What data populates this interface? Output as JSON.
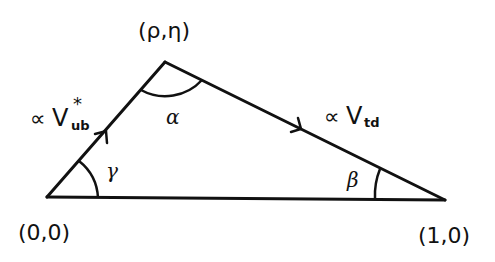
{
  "diagram": {
    "type": "unitarity-triangle",
    "stroke_color": "#111111",
    "background": "#ffffff",
    "vertices": {
      "origin": {
        "label": "(0,0)"
      },
      "apex": {
        "label": "(ρ,η)"
      },
      "right": {
        "label": "(1,0)"
      }
    },
    "angles": {
      "apex": "α",
      "right": "β",
      "origin": "γ"
    },
    "sides": {
      "left": {
        "prefix": "∝",
        "symbol": "V",
        "superscript": "*",
        "subscript": "ub"
      },
      "top": {
        "prefix": "∝",
        "symbol": "V",
        "subscript": "td"
      }
    }
  }
}
